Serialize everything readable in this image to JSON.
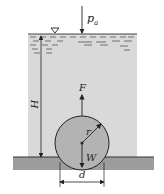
{
  "diagram": {
    "labels": {
      "atmospheric_pressure": "p",
      "atmospheric_pressure_sub": "a",
      "depth": "H",
      "buoyant_force": "F",
      "weight": "W",
      "radius": "r",
      "diameter": "d"
    },
    "colors": {
      "water": "#d9d9d9",
      "ground": "#9c9c9c",
      "cylinder": "#b3b3b3",
      "line": "#222222"
    }
  }
}
